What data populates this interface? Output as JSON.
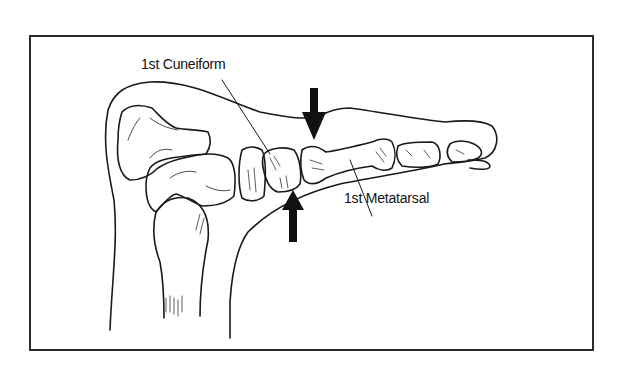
{
  "figure": {
    "labels": [
      {
        "id": "cuneiform",
        "text": "1st Cuneiform"
      },
      {
        "id": "metatarsal",
        "text": "1st Metatarsal"
      }
    ],
    "arrows": [
      {
        "id": "arrow-down",
        "direction": "down",
        "target": "1st cuneiform–metatarsal joint (dorsal)"
      },
      {
        "id": "arrow-up",
        "direction": "up",
        "target": "1st cuneiform–metatarsal joint (plantar)"
      }
    ],
    "colors": {
      "line": "#1a1a1a",
      "background": "#ffffff",
      "frame": "#2a2a2a"
    }
  }
}
